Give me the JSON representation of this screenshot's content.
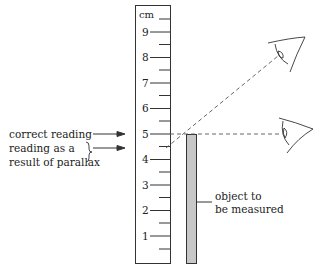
{
  "ruler": {
    "unit": "cm",
    "marks": [
      "1",
      "2",
      "3",
      "4",
      "5",
      "6",
      "7",
      "8",
      "9"
    ]
  },
  "labels": {
    "correct_reading": "correct reading",
    "parallax_line1": "reading as a",
    "parallax_line2": "result of parallax",
    "object_line1": "object to",
    "object_line2": "be measured"
  },
  "colors": {
    "line": "#333333",
    "object_fill": "#c8c8c8",
    "dashed": "#555555"
  }
}
